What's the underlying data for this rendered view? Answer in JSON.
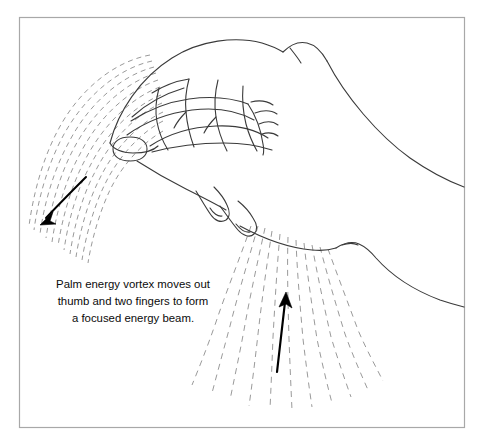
{
  "figure": {
    "title_alt": "Palm energy vortex diagram",
    "frame": {
      "name": "illustration-border",
      "x": 19,
      "y": 17,
      "width": 446,
      "height": 411,
      "stroke_color": "#a8a8a8",
      "fill_color": "#ffffff"
    },
    "caption": {
      "lines": [
        "Palm energy vortex moves out",
        "thumb and two fingers to form",
        "a focused energy beam."
      ],
      "align": "center",
      "center_x": 133,
      "first_line_y": 288,
      "line_height": 17,
      "text_color": "#0b0b0b",
      "font_size_px": 11.4
    },
    "line_art": {
      "stroke_color": "#3a3a3a",
      "stroke_width": 1.1,
      "description": "Side view of a right hand with folded fingers, extended thumb with nail, and two extended fingertips, with forearm extending to the right edge."
    },
    "energy_streams": [
      {
        "name": "palm-vortex-stream",
        "location": "upper-left",
        "direction": "outward-down-left",
        "line_style": "dashed",
        "stroke_color": "#9a9a9a",
        "dash_pattern": "5 4",
        "line_count": 11,
        "arrow": {
          "name": "energy-flow-arrow-left",
          "color": "#000000",
          "from_x": 86,
          "from_y": 177,
          "to_x": 42,
          "to_y": 222
        }
      },
      {
        "name": "finger-beam-stream",
        "location": "lower-center",
        "direction": "inward-up",
        "line_style": "dashed",
        "stroke_color": "#9a9a9a",
        "dash_pattern": "6 5",
        "line_count": 11,
        "arrow": {
          "name": "energy-flow-arrow-right",
          "color": "#000000",
          "from_x": 278,
          "from_y": 370,
          "to_x": 285,
          "to_y": 294
        }
      }
    ]
  }
}
